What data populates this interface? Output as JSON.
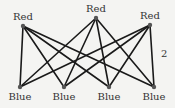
{
  "diagram": {
    "type": "complete-bipartite-graph",
    "name": "K(3,4)",
    "annotation": "2",
    "red_nodes": [
      {
        "label": "Red",
        "x": 23,
        "y": 26
      },
      {
        "label": "Red",
        "x": 96,
        "y": 18
      },
      {
        "label": "Red",
        "x": 150,
        "y": 25
      }
    ],
    "blue_nodes": [
      {
        "label": "Blue",
        "x": 20,
        "y": 87
      },
      {
        "label": "Blue",
        "x": 64,
        "y": 87
      },
      {
        "label": "Blue",
        "x": 109,
        "y": 87
      },
      {
        "label": "Blue",
        "x": 154,
        "y": 87
      }
    ],
    "edge_color": "#1a1a1a",
    "node_color": "#555555",
    "background": "#f4f4f2"
  }
}
